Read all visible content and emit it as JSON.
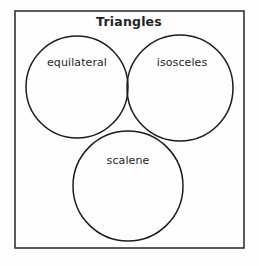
{
  "diagram": {
    "type": "venn-diagram",
    "title": "Triangles",
    "frame": {
      "x": 15,
      "y": 11,
      "width": 229,
      "height": 237,
      "stroke_color": "#333333"
    },
    "background_color": "#fefefe",
    "stroke_color": "#1c1c1c",
    "text_color": "#242424",
    "circles": [
      {
        "label": "equilateral",
        "name": "equilateral",
        "cx": 77,
        "cy": 87,
        "r": 51,
        "label_x": 77,
        "label_y": 66
      },
      {
        "label": "isosceles",
        "name": "isosceles",
        "cx": 180,
        "cy": 88,
        "r": 53,
        "label_x": 182,
        "label_y": 66
      },
      {
        "label": "scalene",
        "name": "scalene",
        "cx": 128,
        "cy": 186,
        "r": 55,
        "label_x": 128,
        "label_y": 164
      }
    ],
    "title_x": 129,
    "title_y": 26
  }
}
